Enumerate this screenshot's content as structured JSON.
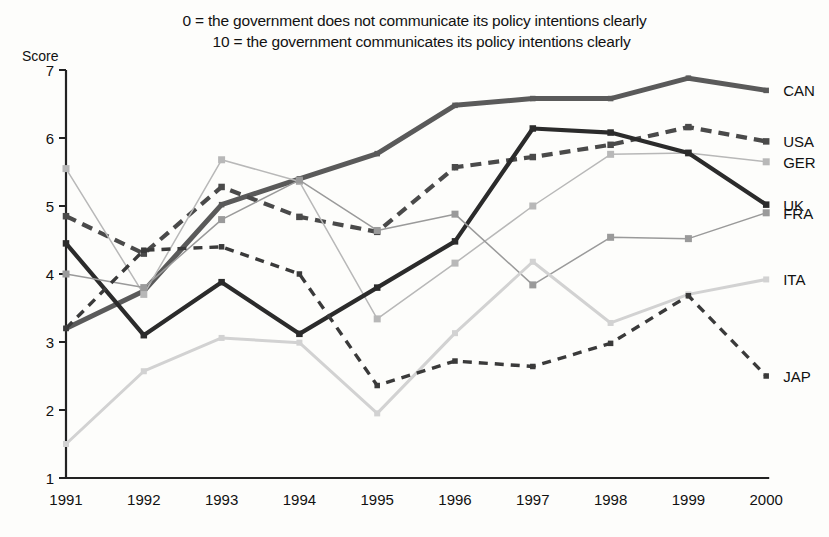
{
  "chart_data": {
    "type": "line",
    "title": "0 = the government does not communicate its policy intentions clearly",
    "subtitle": "10 = the government communicates its policy intentions clearly",
    "xlabel": "",
    "ylabel": "Score",
    "ylim": [
      1,
      7
    ],
    "yticks": [
      1,
      2,
      3,
      4,
      5,
      6,
      7
    ],
    "ytick_labels": [
      "1",
      "2",
      "3",
      "4",
      "5",
      "6",
      "7"
    ],
    "grid": false,
    "legend_position": "right-end-of-line",
    "categories": [
      "1991",
      "1992",
      "1993",
      "1994",
      "1995",
      "1996",
      "1997",
      "1998",
      "1999",
      "2000"
    ],
    "series": [
      {
        "name": "CAN",
        "label": "CAN",
        "color": "#5a5a5a",
        "style": "solid-thick",
        "values": [
          3.2,
          3.75,
          5.02,
          5.4,
          5.77,
          6.48,
          6.58,
          6.58,
          6.88,
          6.7
        ]
      },
      {
        "name": "USA",
        "label": "USA",
        "color": "#4a4a4a",
        "style": "dashed-thick",
        "values": [
          4.85,
          4.3,
          5.28,
          4.84,
          4.62,
          5.57,
          5.72,
          5.9,
          6.16,
          5.95
        ]
      },
      {
        "name": "GER",
        "label": "GER",
        "color": "#b8b8b8",
        "style": "solid-thin",
        "values": [
          5.55,
          3.7,
          5.68,
          5.36,
          3.34,
          4.16,
          5.0,
          5.76,
          5.78,
          5.65
        ]
      },
      {
        "name": "UK",
        "label": "UK",
        "color": "#2b2b2b",
        "style": "solid-thick-dark",
        "values": [
          4.45,
          3.1,
          3.88,
          3.12,
          3.8,
          4.48,
          6.14,
          6.08,
          5.78,
          5.02
        ]
      },
      {
        "name": "FRA",
        "label": "FRA",
        "color": "#9a9a9a",
        "style": "solid-thin",
        "values": [
          4.0,
          3.8,
          4.8,
          5.38,
          4.64,
          4.88,
          3.84,
          4.54,
          4.52,
          4.9
        ]
      },
      {
        "name": "ITA",
        "label": "ITA",
        "color": "#d2d2d2",
        "style": "solid-medium",
        "values": [
          1.5,
          2.57,
          3.06,
          2.99,
          1.95,
          3.13,
          4.18,
          3.28,
          3.7,
          3.92
        ]
      },
      {
        "name": "JAP",
        "label": "JAP",
        "color": "#3a3a3a",
        "style": "dashed-medium",
        "values": [
          3.2,
          4.35,
          4.4,
          4.0,
          2.36,
          2.72,
          2.64,
          2.98,
          3.68,
          2.5
        ]
      }
    ]
  },
  "axis": {
    "y_title": "Score"
  }
}
